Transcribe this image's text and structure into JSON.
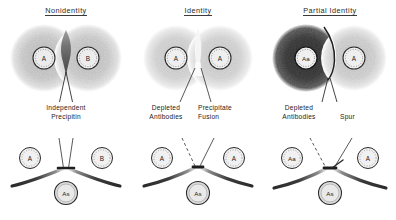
{
  "figure": {
    "background_color": "#ffffff",
    "ink_color": "#1d1d1d"
  },
  "panels": [
    {
      "id": "nonidentity",
      "title": "Nonidentity",
      "plate": {
        "description": "two overlapping diffusion halos with a dark wedge of crossed precipitin between them",
        "halo_left_color": "#cfcfcf",
        "halo_right_color": "#cfcfcf",
        "band_color": "#6e6e6e",
        "wells": [
          {
            "label": "A",
            "position": "left"
          },
          {
            "label": "B",
            "position": "right"
          }
        ]
      },
      "annotations": [
        {
          "name": "independent-precipitin",
          "lines": [
            "Independent",
            "Precipitin"
          ]
        }
      ],
      "schematic": {
        "antigen_wells": [
          {
            "label": "A",
            "position": "left"
          },
          {
            "label": "B",
            "position": "right"
          }
        ],
        "antiserum_well": {
          "label": "As"
        },
        "pattern": "crossed-lines"
      }
    },
    {
      "id": "identity",
      "title": "Identity",
      "plate": {
        "description": "two overlapping diffusion halos meeting in a pale fused zone, no crossing",
        "halo_left_color": "#d8d8d8",
        "halo_right_color": "#d8d8d8",
        "band_color": "#f2f2f2",
        "wells": [
          {
            "label": "A",
            "position": "left"
          },
          {
            "label": "A",
            "position": "right"
          }
        ]
      },
      "annotations": [
        {
          "name": "depleted-antibodies",
          "lines": [
            "Depleted",
            "Antibodies"
          ]
        },
        {
          "name": "precipitate-fusion",
          "lines": [
            "Precipitate",
            "Fusion"
          ]
        }
      ],
      "schematic": {
        "antigen_wells": [
          {
            "label": "A",
            "position": "left"
          },
          {
            "label": "A",
            "position": "right"
          }
        ],
        "antiserum_well": {
          "label": "As"
        },
        "pattern": "fused-arc"
      }
    },
    {
      "id": "partial-identity",
      "title": "Partial Identity",
      "plate": {
        "description": "dark halo on the left, light halo on the right, bright curved spur between them",
        "halo_left_color": "#4a4a4a",
        "halo_right_color": "#d5d5d5",
        "band_color": "#ffffff",
        "wells": [
          {
            "label": "Aa",
            "position": "left"
          },
          {
            "label": "A",
            "position": "right"
          }
        ]
      },
      "annotations": [
        {
          "name": "depleted-antibodies",
          "lines": [
            "Depleted",
            "Antibodies"
          ]
        },
        {
          "name": "spur",
          "lines": [
            "Spur"
          ]
        }
      ],
      "schematic": {
        "antigen_wells": [
          {
            "label": "Aa",
            "position": "left"
          },
          {
            "label": "A",
            "position": "right"
          }
        ],
        "antiserum_well": {
          "label": "As"
        },
        "pattern": "arc-with-spur"
      }
    }
  ]
}
